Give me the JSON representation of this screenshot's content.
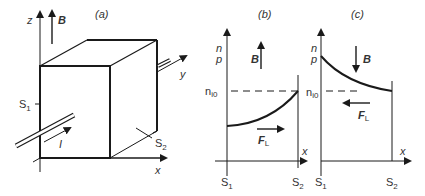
{
  "panels": {
    "a": {
      "title": "(a)",
      "axis_z": "z",
      "axis_y": "y",
      "axis_x": "x",
      "field": "B",
      "current": "I",
      "surface1": "S",
      "surface1_sub": "1",
      "surface2": "S",
      "surface2_sub": "2"
    },
    "b": {
      "title": "(b)",
      "ylabel_n": "n",
      "ylabel_p": "p",
      "level": "n",
      "level_sub": "i0",
      "field": "B",
      "force": "F",
      "force_sub": "L",
      "axis_x": "x",
      "s1": "S",
      "s1_sub": "1",
      "s2": "S",
      "s2_sub": "2"
    },
    "c": {
      "title": "(c)",
      "ylabel_n": "n",
      "ylabel_p": "p",
      "level": "n",
      "level_sub": "i0",
      "field": "B",
      "force": "F",
      "force_sub": "L",
      "axis_x": "x",
      "s1": "S",
      "s1_sub": "1",
      "s2": "S",
      "s2_sub": "2"
    }
  },
  "colors": {
    "line": "#1a1a1a",
    "text": "#333333"
  }
}
